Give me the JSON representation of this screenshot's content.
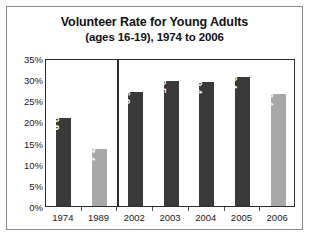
{
  "chart_data": {
    "type": "bar",
    "title": "Volunteer Rate for Young Adults",
    "subtitle": "(ages 16-19), 1974 to 2006",
    "xlabel": "",
    "ylabel": "",
    "ylim": [
      0,
      35
    ],
    "ytick_step": 5,
    "ytick_labels": [
      "0%",
      "5%",
      "10%",
      "15%",
      "20%",
      "25%",
      "30%",
      "35%"
    ],
    "ytick_values": [
      0,
      5,
      10,
      15,
      20,
      25,
      30,
      35
    ],
    "grid": false,
    "legend": "none",
    "categories": [
      "1974",
      "1989",
      "2002",
      "2003",
      "2004",
      "2005",
      "2006"
    ],
    "values": [
      20.9,
      13.4,
      26.9,
      29.5,
      29.4,
      30.4,
      26.4
    ],
    "value_labels": [
      "20.9",
      "13.4",
      "26.9",
      "29.5",
      "29.4",
      "30.4",
      "26.4"
    ],
    "bar_shades": [
      "dark",
      "light",
      "dark",
      "dark",
      "dark",
      "dark",
      "light"
    ],
    "group_divider_after_index": 1,
    "colors": {
      "bar_dark": "#3a3a3a",
      "bar_light": "#a8a8a8",
      "value_label": "#ffffff",
      "axis": "#2b2b2b",
      "frame": "#8c8c8c",
      "text": "#1a1a1a",
      "background": "#ffffff"
    }
  }
}
